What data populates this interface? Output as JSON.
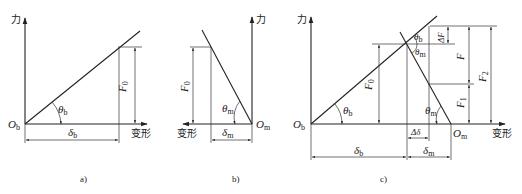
{
  "axes": {
    "force_label": "力",
    "deformation_label": "变形"
  },
  "panel_a": {
    "caption": "a)",
    "origin_label": "O",
    "origin_sub": "b",
    "angle_label": "θ",
    "angle_sub": "b",
    "force_label": "F",
    "force_sub": "0",
    "deform_label": "δ",
    "deform_sub": "b"
  },
  "panel_b": {
    "caption": "b)",
    "origin_label": "O",
    "origin_sub": "m",
    "angle_label": "θ",
    "angle_sub": "m",
    "force_label": "F",
    "force_sub": "0",
    "deform_label": "δ",
    "deform_sub": "m"
  },
  "panel_c": {
    "caption": "c)",
    "origin_b_label": "O",
    "origin_b_sub": "b",
    "origin_m_label": "O",
    "origin_m_sub": "m",
    "theta_b": "θ",
    "theta_b_sub": "b",
    "theta_m": "θ",
    "theta_m_sub": "m",
    "f0_label": "F",
    "f0_sub": "0",
    "delta_f_label": "ΔF",
    "f_label": "F",
    "f1_label": "F",
    "f1_sub": "1",
    "f2_label": "F",
    "f2_sub": "2",
    "delta_delta_label": "Δδ",
    "deform_b_label": "δ",
    "deform_b_sub": "b",
    "deform_m_label": "δ",
    "deform_m_sub": "m"
  }
}
